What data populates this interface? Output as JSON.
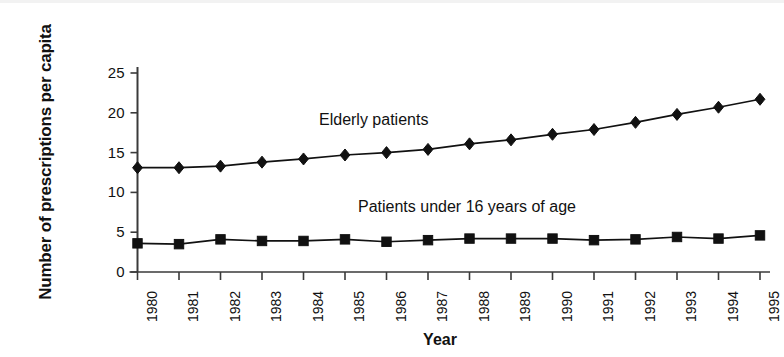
{
  "chart_data": {
    "type": "line",
    "title": "",
    "xlabel": "Year",
    "ylabel": "Number of prescriptions per capita",
    "categories": [
      "1980",
      "1981",
      "1982",
      "1983",
      "1984",
      "1985",
      "1986",
      "1987",
      "1988",
      "1989",
      "1990",
      "1991",
      "1992",
      "1993",
      "1994",
      "1995"
    ],
    "x": [
      1980,
      1981,
      1982,
      1983,
      1984,
      1985,
      1986,
      1987,
      1988,
      1989,
      1990,
      1991,
      1992,
      1993,
      1994,
      1995
    ],
    "ylim": [
      0,
      25
    ],
    "yticks": [
      0,
      5,
      10,
      15,
      20,
      25
    ],
    "ytick_labels": [
      "0",
      "5",
      "10",
      "15",
      "20",
      "25"
    ],
    "grid": false,
    "legend_position": "inline-annotation",
    "series": [
      {
        "name": "Elderly patients",
        "marker": "diamond",
        "color": "#111111",
        "values": [
          13.1,
          13.1,
          13.3,
          13.8,
          14.2,
          14.7,
          15.0,
          15.4,
          16.1,
          16.6,
          17.3,
          17.9,
          18.8,
          19.8,
          20.7,
          21.7
        ]
      },
      {
        "name": "Patients under 16 years of age",
        "marker": "square",
        "color": "#111111",
        "values": [
          3.6,
          3.5,
          4.1,
          3.9,
          3.9,
          4.1,
          3.8,
          4.0,
          4.2,
          4.2,
          4.2,
          4.0,
          4.1,
          4.4,
          4.2,
          4.6
        ]
      }
    ],
    "annotations": [
      {
        "text": "Elderly patients",
        "series": "Elderly patients"
      },
      {
        "text": "Patients under 16 years of age",
        "series": "Patients under 16 years of age"
      }
    ]
  },
  "axes": {
    "y_title": "Number of prescriptions per capita",
    "x_title": "Year"
  },
  "colors": {
    "ink": "#111111",
    "axis": "#3a3a3a",
    "background": "#ffffff"
  }
}
